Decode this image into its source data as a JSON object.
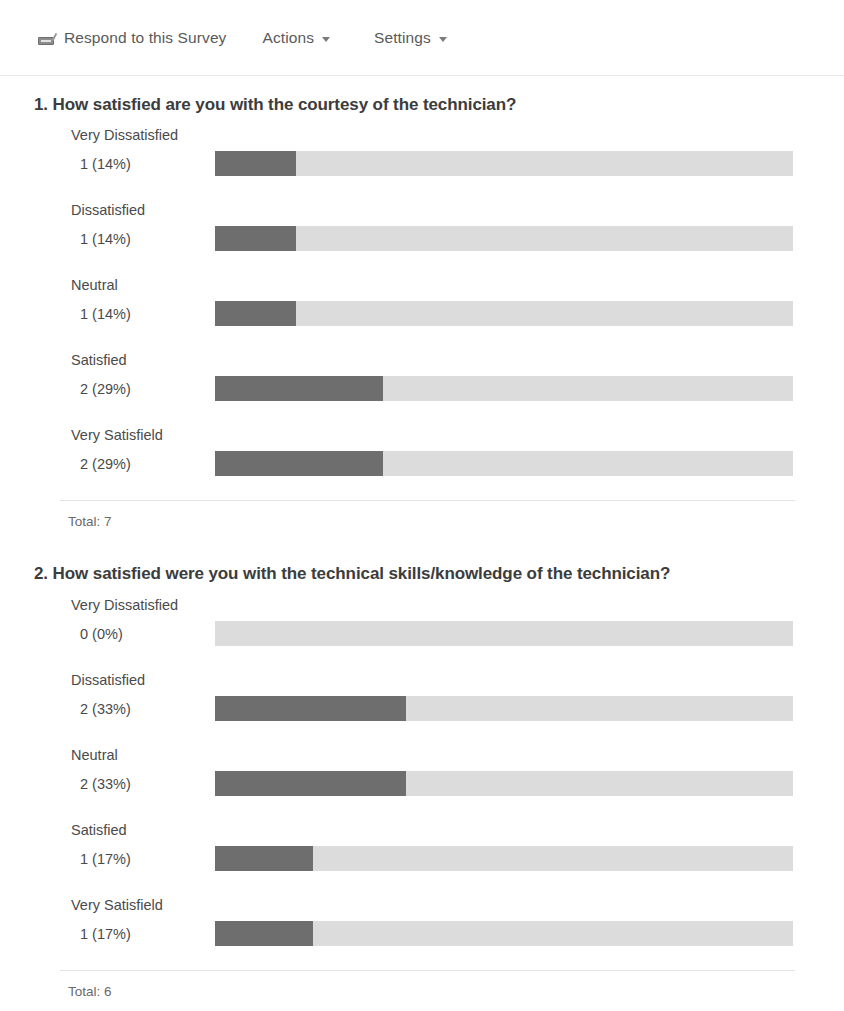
{
  "toolbar": {
    "respond_label": "Respond to this Survey",
    "respond_icon": "survey-respond-icon",
    "actions_label": "Actions",
    "settings_label": "Settings",
    "caret_icon": "chevron-down-icon"
  },
  "colors": {
    "bar_fill": "#6e6e6e",
    "bar_track": "#dcdcdc",
    "text": "#444444",
    "divider": "#e7e7e7"
  },
  "chart_data": [
    {
      "type": "bar",
      "title": "1. How satisfied are you with the courtesy of the technician?",
      "number": "1.",
      "orientation": "horizontal",
      "categories": [
        "Very Dissatisfied",
        "Dissatisfied",
        "Neutral",
        "Satisfied",
        "Very Satisfield"
      ],
      "values": [
        1,
        1,
        1,
        2,
        2
      ],
      "percents": [
        14,
        14,
        14,
        29,
        29
      ],
      "labels": [
        "1 (14%)",
        "1 (14%)",
        "1 (14%)",
        "2 (29%)",
        "2 (29%)"
      ],
      "total": 7,
      "total_label": "Total: 7",
      "xlabel": "",
      "ylabel": "",
      "xlim": [
        0,
        100
      ],
      "grid": false,
      "legend": "none"
    },
    {
      "type": "bar",
      "title": "2. How satisfied were you with the technical skills/knowledge of the technician?",
      "number": "2.",
      "orientation": "horizontal",
      "categories": [
        "Very Dissatisfied",
        "Dissatisfied",
        "Neutral",
        "Satisfied",
        "Very Satisfield"
      ],
      "values": [
        0,
        2,
        2,
        1,
        1
      ],
      "percents": [
        0,
        33,
        33,
        17,
        17
      ],
      "labels": [
        "0 (0%)",
        "2 (33%)",
        "2 (33%)",
        "1 (17%)",
        "1 (17%)"
      ],
      "total": 6,
      "total_label": "Total: 6",
      "xlabel": "",
      "ylabel": "",
      "xlim": [
        0,
        100
      ],
      "grid": false,
      "legend": "none"
    }
  ]
}
